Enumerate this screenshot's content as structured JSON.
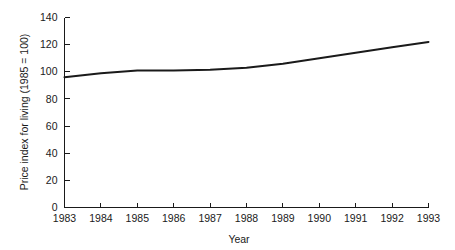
{
  "chart_data": {
    "type": "line",
    "title": "",
    "xlabel": "Year",
    "ylabel": "Price index for living (1985 = 100)",
    "categories": [
      "1983",
      "1984",
      "1985",
      "1986",
      "1987",
      "1988",
      "1989",
      "1990",
      "1991",
      "1992",
      "1993"
    ],
    "x": [
      1983,
      1984,
      1985,
      1986,
      1987,
      1988,
      1989,
      1990,
      1991,
      1992,
      1993
    ],
    "values": [
      96,
      99,
      101,
      101,
      101.5,
      103,
      106,
      110,
      114,
      118,
      122
    ],
    "series": [
      {
        "name": "Price index for living",
        "values": [
          96,
          99,
          101,
          101,
          101.5,
          103,
          106,
          110,
          114,
          118,
          122
        ]
      }
    ],
    "xlim": [
      1983,
      1993
    ],
    "ylim": [
      0,
      140
    ],
    "xticks": [
      1983,
      1984,
      1985,
      1986,
      1987,
      1988,
      1989,
      1990,
      1991,
      1992,
      1993
    ],
    "yticks": [
      0,
      20,
      40,
      60,
      80,
      100,
      120,
      140
    ],
    "xtick_labels": [
      "1983",
      "1984",
      "1985",
      "1986",
      "1987",
      "1988",
      "1989",
      "1990",
      "1991",
      "1992",
      "1993"
    ],
    "ytick_labels": [
      "0",
      "20",
      "40",
      "60",
      "80",
      "100",
      "120",
      "140"
    ],
    "grid": false,
    "legend": false,
    "legend_position": "none",
    "line_color": "#1a1a1a",
    "background_color": "#ffffff",
    "annotations": []
  },
  "axes": {
    "x_axis_label": "Year",
    "y_axis_label": "Price index for living (1985 = 100)"
  }
}
